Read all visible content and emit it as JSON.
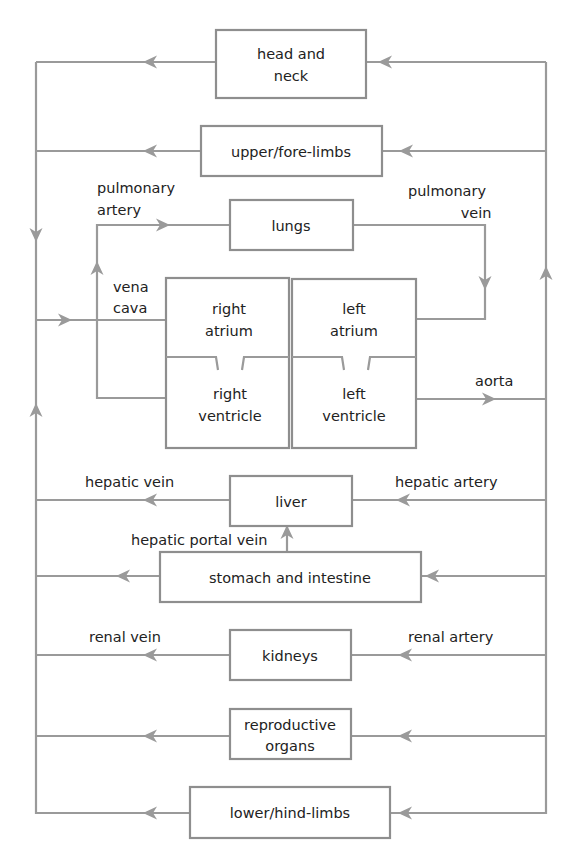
{
  "diagram": {
    "type": "circulatory-system-flow",
    "colors": {
      "line": "#9a9a9a",
      "box_border": "#8e8e8e",
      "text": "#222222",
      "background": "#ffffff"
    },
    "organs": {
      "head_neck": [
        "head and",
        "neck"
      ],
      "upper_limbs": [
        "upper/fore-limbs"
      ],
      "lungs": [
        "lungs"
      ],
      "right_atrium": [
        "right",
        "atrium"
      ],
      "right_ventricle": [
        "right",
        "ventricle"
      ],
      "left_atrium": [
        "left",
        "atrium"
      ],
      "left_ventricle": [
        "left",
        "ventricle"
      ],
      "liver": [
        "liver"
      ],
      "stomach_intestine": [
        "stomach and intestine"
      ],
      "kidneys": [
        "kidneys"
      ],
      "reproductive": [
        "reproductive",
        "organs"
      ],
      "lower_limbs": [
        "lower/hind-limbs"
      ]
    },
    "vessels": {
      "pulmonary_artery": [
        "pulmonary",
        "artery"
      ],
      "pulmonary_vein": [
        "pulmonary",
        "vein"
      ],
      "vena_cava": [
        "vena",
        "cava"
      ],
      "aorta": "aorta",
      "hepatic_vein": "hepatic vein",
      "hepatic_artery": "hepatic artery",
      "hepatic_portal_vein": "hepatic portal vein",
      "renal_vein": "renal vein",
      "renal_artery": "renal artery"
    }
  }
}
